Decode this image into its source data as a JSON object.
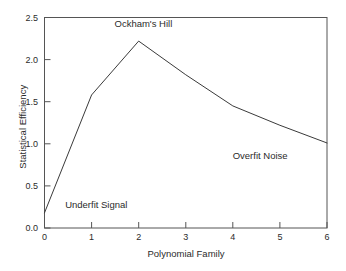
{
  "chart_data": {
    "type": "line",
    "title": "",
    "xlabel": "Polynomial Family",
    "ylabel": "Statistical Efficiency",
    "x": [
      0,
      1,
      2,
      3,
      4,
      5,
      6
    ],
    "values": [
      0.18,
      1.58,
      2.22,
      1.82,
      1.45,
      1.22,
      1.01
    ],
    "series": [
      {
        "name": "Statistical Efficiency",
        "values": [
          0.18,
          1.58,
          2.22,
          1.82,
          1.45,
          1.22,
          1.01
        ]
      }
    ],
    "xlim": [
      0,
      6
    ],
    "ylim": [
      0.0,
      2.5
    ],
    "xticks": [
      "0",
      "1",
      "2",
      "3",
      "4",
      "5",
      "6"
    ],
    "yticks": [
      "0.0",
      "0.5",
      "1.0",
      "1.5",
      "2.0",
      "2.5"
    ],
    "grid": false,
    "legend": "none",
    "line_color": "#3a3a3a",
    "frame_color": "#555555",
    "background": "#ffffff",
    "annotations": [
      {
        "text": "Ockham's Hill",
        "x": 2.1,
        "y": 2.42
      },
      {
        "text": "Underfit Signal",
        "x": 1.1,
        "y": 0.27
      },
      {
        "text": "Overfit Noise",
        "x": 4.58,
        "y": 0.86
      }
    ]
  }
}
